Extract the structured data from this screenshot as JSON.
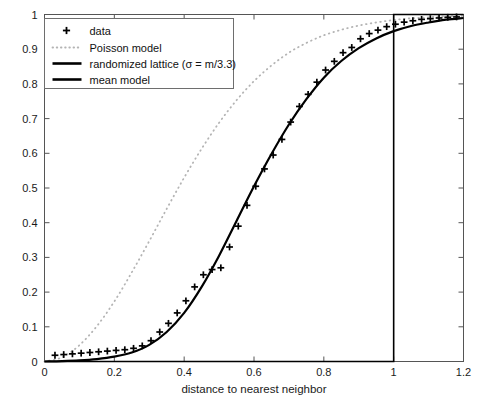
{
  "chart_data": {
    "type": "line",
    "title": "",
    "xlabel": "distance to nearest neighbor",
    "ylabel": "",
    "xlim": [
      0,
      1.2
    ],
    "ylim": [
      0,
      1
    ],
    "grid": false,
    "legend_position": "top-left",
    "xticks": [
      0,
      0.2,
      0.4,
      0.6,
      0.8,
      1,
      1.2
    ],
    "xtick_labels": [
      "0",
      "0.2",
      "0.4",
      "0.6",
      "0.8",
      "1",
      "1.2"
    ],
    "yticks": [
      0,
      0.1,
      0.2,
      0.3,
      0.4,
      0.5,
      0.6,
      0.7,
      0.8,
      0.9,
      1
    ],
    "ytick_labels": [
      "0",
      "0.1",
      "0.2",
      "0.3",
      "0.4",
      "0.5",
      "0.6",
      "0.7",
      "0.8",
      "0.9",
      "1"
    ],
    "series": [
      {
        "name": "data",
        "style": "marker",
        "marker": "plus",
        "color": "#000000",
        "x": [
          0.03,
          0.055,
          0.08,
          0.105,
          0.13,
          0.155,
          0.18,
          0.205,
          0.23,
          0.255,
          0.28,
          0.305,
          0.33,
          0.355,
          0.38,
          0.405,
          0.43,
          0.455,
          0.48,
          0.505,
          0.53,
          0.555,
          0.58,
          0.605,
          0.63,
          0.655,
          0.68,
          0.705,
          0.73,
          0.755,
          0.78,
          0.805,
          0.83,
          0.855,
          0.88,
          0.905,
          0.93,
          0.955,
          0.98,
          1.005,
          1.03,
          1.055,
          1.08,
          1.105,
          1.13,
          1.155,
          1.18
        ],
        "y": [
          0.018,
          0.02,
          0.022,
          0.024,
          0.026,
          0.028,
          0.03,
          0.032,
          0.034,
          0.038,
          0.045,
          0.06,
          0.085,
          0.11,
          0.14,
          0.175,
          0.215,
          0.25,
          0.265,
          0.27,
          0.33,
          0.39,
          0.45,
          0.505,
          0.555,
          0.595,
          0.64,
          0.69,
          0.735,
          0.77,
          0.805,
          0.84,
          0.865,
          0.89,
          0.905,
          0.93,
          0.945,
          0.955,
          0.965,
          0.972,
          0.978,
          0.982,
          0.986,
          0.988,
          0.99,
          0.992,
          0.993
        ]
      },
      {
        "name": "Poisson model",
        "style": "dotted",
        "color": "#b4b4b4",
        "x": [
          0.0,
          0.05,
          0.1,
          0.15,
          0.2,
          0.25,
          0.3,
          0.35,
          0.4,
          0.45,
          0.5,
          0.55,
          0.6,
          0.65,
          0.7,
          0.75,
          0.8,
          0.85,
          0.9,
          0.95,
          1.0,
          1.05,
          1.1,
          1.15,
          1.2
        ],
        "y": [
          0.0,
          0.012,
          0.047,
          0.102,
          0.173,
          0.257,
          0.347,
          0.44,
          0.53,
          0.613,
          0.688,
          0.753,
          0.808,
          0.853,
          0.89,
          0.918,
          0.94,
          0.956,
          0.968,
          0.977,
          0.984,
          0.989,
          0.992,
          0.995,
          0.996
        ]
      },
      {
        "name": "randomized lattice (σ = m/3.3)",
        "style": "solid",
        "color": "#000000",
        "x": [
          0.0,
          0.05,
          0.1,
          0.15,
          0.2,
          0.25,
          0.3,
          0.35,
          0.4,
          0.45,
          0.5,
          0.55,
          0.6,
          0.65,
          0.7,
          0.75,
          0.8,
          0.85,
          0.9,
          0.95,
          1.0,
          1.05,
          1.1,
          1.15,
          1.2
        ],
        "y": [
          0.0,
          0.001,
          0.003,
          0.007,
          0.014,
          0.026,
          0.048,
          0.085,
          0.14,
          0.215,
          0.305,
          0.405,
          0.505,
          0.598,
          0.683,
          0.756,
          0.818,
          0.866,
          0.903,
          0.931,
          0.952,
          0.967,
          0.977,
          0.985,
          0.99
        ]
      },
      {
        "name": "mean model",
        "style": "step",
        "color": "#000000",
        "x": [
          0.0,
          1.0,
          1.0,
          1.2
        ],
        "y": [
          0.0,
          0.0,
          1.0,
          1.0
        ]
      }
    ],
    "legend_entries": [
      {
        "label": "data",
        "sample": "plus-marker"
      },
      {
        "label": "Poisson model",
        "sample": "dotted-line"
      },
      {
        "label": "randomized lattice (σ = m/3.3)",
        "sample": "solid-line"
      },
      {
        "label": "mean model",
        "sample": "solid-line-thick"
      }
    ],
    "colors": {
      "axis": "#555555",
      "data": "#000000",
      "poisson": "#b4b4b4",
      "lattice": "#000000",
      "mean": "#000000",
      "background": "#ffffff"
    }
  }
}
